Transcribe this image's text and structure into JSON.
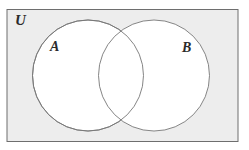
{
  "figure": {
    "type": "venn-diagram",
    "set_count": 2
  },
  "labels": {
    "universe": "U",
    "set_a": "A",
    "set_b": "B"
  },
  "colors": {
    "page_background": "#ffffff",
    "universe_fill": "#ededed",
    "universe_stroke": "#6e6e6e",
    "circle_fill": "#ffffff",
    "circle_stroke": "#777777",
    "label_color": "#2b2b2b"
  },
  "geometry": {
    "canvas": {
      "width": 249,
      "height": 150
    },
    "universe_rect": {
      "x": 7,
      "y": 9.5,
      "width": 231,
      "height": 132,
      "stroke_width": 1
    },
    "circle_a": {
      "cx": 88,
      "cy": 75.5,
      "r": 55.5,
      "stroke_width": 0.9
    },
    "circle_b": {
      "cx": 154,
      "cy": 75.5,
      "r": 55.5,
      "stroke_width": 0.9
    }
  }
}
